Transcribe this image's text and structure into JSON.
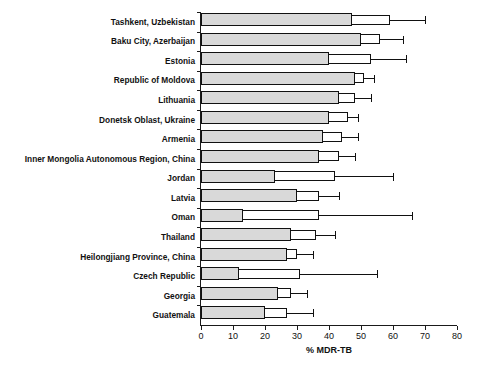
{
  "chart_data": {
    "type": "bar",
    "title": "",
    "subtitle": "",
    "xlabel": "% MDR-TB",
    "ylabel": "",
    "xlim": [
      0,
      80
    ],
    "xticks": [
      0,
      10,
      20,
      30,
      40,
      50,
      60,
      70,
      80
    ],
    "xtick_labels": [
      "0",
      "10",
      "20",
      "30",
      "40",
      "50",
      "60",
      "70",
      "80"
    ],
    "grid": false,
    "legend": null,
    "orientation": "horizontal",
    "bar_fill_color": "#d9d9d9",
    "bar_edge_color": "#111111",
    "categories": [
      "Tashkent, Uzbekistan",
      "Baku City, Azerbaijan",
      "Estonia",
      "Republic of Moldova",
      "Lithuania",
      "Donetsk Oblast, Ukraine",
      "Armenia",
      "Inner Mongolia Autonomous Region, China",
      "Jordan",
      "Latvia",
      "Oman",
      "Thailand",
      "Heilongjiang Province, China",
      "Czech Republic",
      "Georgia",
      "Guatemala"
    ],
    "values": [
      47.2,
      50.0,
      40.0,
      48.0,
      43.0,
      40.0,
      38.0,
      37.0,
      23.0,
      30.0,
      13.0,
      28.0,
      27.0,
      12.0,
      24.0,
      20.0
    ],
    "ci_low": [
      47.2,
      50.0,
      40.0,
      48.0,
      43.0,
      40.0,
      38.0,
      37.0,
      23.0,
      30.0,
      13.0,
      28.0,
      27.0,
      12.0,
      24.0,
      20.0
    ],
    "ci_high": [
      59.0,
      56.0,
      53.0,
      51.0,
      48.0,
      46.0,
      44.0,
      43.0,
      42.0,
      37.0,
      37.0,
      36.0,
      30.0,
      31.0,
      28.0,
      27.0
    ],
    "whisker_high": [
      70.0,
      63.0,
      64.0,
      54.0,
      53.0,
      49.0,
      49.0,
      48.0,
      60.0,
      43.0,
      66.0,
      42.0,
      35.0,
      55.0,
      33.0,
      35.0
    ],
    "series": [
      {
        "name": "% MDR-TB",
        "values": [
          47.2,
          50.0,
          40.0,
          48.0,
          43.0,
          40.0,
          38.0,
          37.0,
          23.0,
          30.0,
          13.0,
          28.0,
          27.0,
          12.0,
          24.0,
          20.0
        ]
      }
    ]
  }
}
